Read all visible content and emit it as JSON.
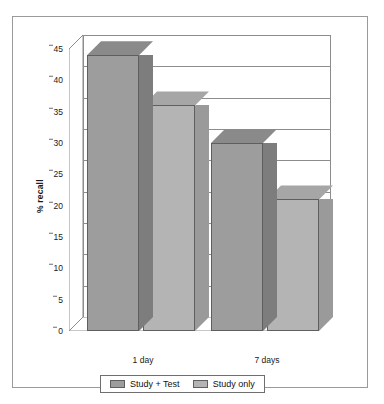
{
  "chart_data": {
    "type": "bar",
    "title": "",
    "xlabel": "",
    "ylabel": "% recall",
    "categories": [
      "1 day",
      "7 days"
    ],
    "series": [
      {
        "name": "Study + Test",
        "values": [
          44,
          30
        ],
        "color": "#9d9d9d"
      },
      {
        "name": "Study only",
        "values": [
          36,
          21
        ],
        "color": "#b4b4b4"
      }
    ],
    "ylim": [
      0,
      45
    ],
    "yticks": [
      0,
      5,
      10,
      15,
      20,
      25,
      30,
      35,
      40,
      45
    ],
    "ytick_labels": [
      "0",
      "5",
      "10",
      "15",
      "20",
      "25",
      "30",
      "35",
      "40",
      "45"
    ],
    "grid": true,
    "grid_axis": "y",
    "legend_position": "bottom",
    "three_d": true,
    "plot_background": "#ffffff",
    "border_color": "#9a9a9a"
  },
  "legend": {
    "items": [
      {
        "label": "Study + Test",
        "color": "#9d9d9d"
      },
      {
        "label": "Study only",
        "color": "#b4b4b4"
      }
    ]
  },
  "axis": {
    "y_title": "% recall"
  }
}
